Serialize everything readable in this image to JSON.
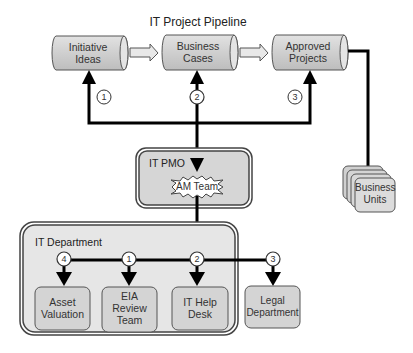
{
  "title": "IT Project Pipeline",
  "pipeline": [
    {
      "label": "Initiative Ideas",
      "lines": [
        "Initiative",
        "Ideas"
      ]
    },
    {
      "label": "Business Cases",
      "lines": [
        "Business",
        "Cases"
      ]
    },
    {
      "label": "Approved Projects",
      "lines": [
        "Approved",
        "Projects"
      ]
    }
  ],
  "pipeline_step_numbers": [
    "1",
    "2",
    "3"
  ],
  "pmo": {
    "label": "IT PMO",
    "team": "AM Team"
  },
  "business_units": {
    "lines": [
      "Business",
      "Units"
    ]
  },
  "it_department": {
    "label": "IT Department",
    "units": [
      {
        "number": "4",
        "lines": [
          "Asset",
          "Valuation"
        ]
      },
      {
        "number": "1",
        "lines": [
          "EIA",
          "Review",
          "Team"
        ]
      },
      {
        "number": "2",
        "lines": [
          "IT Help",
          "Desk"
        ]
      }
    ]
  },
  "legal": {
    "number": "3",
    "lines": [
      "Legal",
      "Department"
    ]
  },
  "colors": {
    "box_fill": "#d4d4d4",
    "box_stroke": "#555555",
    "line": "#000000",
    "container_fill": "#e6e6e6"
  }
}
